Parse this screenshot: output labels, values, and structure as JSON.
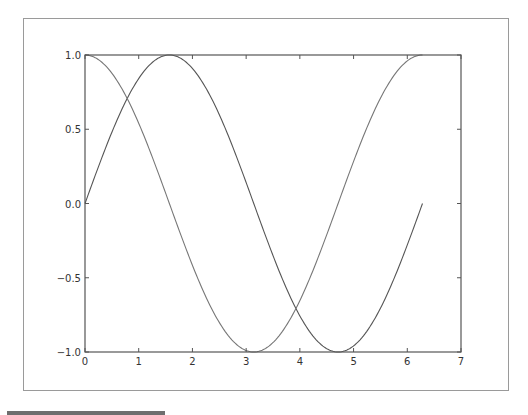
{
  "chart_data": {
    "type": "line",
    "title": "",
    "xlabel": "",
    "ylabel": "",
    "xlim": [
      0,
      7
    ],
    "ylim": [
      -1.0,
      1.0
    ],
    "grid": false,
    "legend": null,
    "x_ticks": [
      "0",
      "1",
      "2",
      "3",
      "4",
      "5",
      "6",
      "7"
    ],
    "y_ticks": [
      "1.0",
      "0.5",
      "0.0",
      "−0.5",
      "−1.0"
    ],
    "x": [
      0,
      0.5,
      1.0,
      1.5708,
      2.0,
      2.5,
      3.1416,
      3.5,
      4.0,
      4.7124,
      5.0,
      5.5,
      6.0,
      6.2832
    ],
    "series": [
      {
        "name": "sin(x)",
        "color": "#555555",
        "values": [
          0.0,
          0.479,
          0.841,
          1.0,
          0.909,
          0.598,
          0.0,
          -0.351,
          -0.757,
          -1.0,
          -0.959,
          -0.706,
          -0.279,
          0.0
        ]
      },
      {
        "name": "cos(x)",
        "color": "#777777",
        "values": [
          1.0,
          0.878,
          0.54,
          0.0,
          -0.416,
          -0.801,
          -1.0,
          -0.936,
          -0.654,
          0.0,
          0.284,
          0.709,
          0.96,
          1.0
        ]
      }
    ]
  },
  "colors": {
    "axes": "#555555",
    "frame": "#9a9a9a",
    "tick_text": "#333333"
  }
}
